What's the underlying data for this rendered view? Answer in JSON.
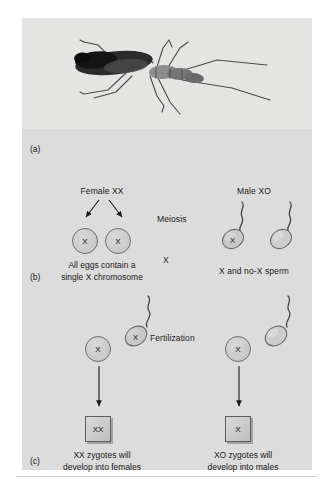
{
  "figure": {
    "panels": [
      {
        "key": "a",
        "letter": "(a)"
      },
      {
        "key": "b",
        "letter": "(b)"
      },
      {
        "key": "c",
        "letter": "(c)"
      }
    ]
  },
  "photo": {
    "subject": "water-strider-insect",
    "alt_text": "Photograph of a water strider insect with a dark elongated body and long slender legs"
  },
  "meiosis": {
    "female_label": "Female XX",
    "male_label": "Male XO",
    "process_label": "Meiosis",
    "cross_symbol": "X",
    "egg_caption_line1": "All eggs contain a",
    "egg_caption_line2": "single X chromosome",
    "sperm_caption": "X and no-X sperm",
    "eggs": [
      {
        "name": "egg-left",
        "glyph": "X"
      },
      {
        "name": "egg-right",
        "glyph": "X"
      }
    ],
    "sperm": [
      {
        "name": "sperm-x",
        "glyph": "X"
      },
      {
        "name": "sperm-no-x",
        "glyph": ""
      }
    ]
  },
  "fertilization": {
    "process_label": "Fertilization",
    "left": {
      "egg_glyph": "X",
      "sperm_glyph": "X",
      "zygote_glyph": "XX",
      "caption_line1": "XX zygotes will",
      "caption_line2": "develop into females"
    },
    "right": {
      "egg_glyph": "X",
      "sperm_glyph": "",
      "zygote_glyph": "X",
      "caption_line1": "XO zygotes will",
      "caption_line2": "develop into males"
    }
  },
  "colors": {
    "panel_background": "#dcdcdc",
    "photo_background": "#e4e4e2",
    "cell_fill": "#cfcfcf",
    "cell_outline": "#6d6d6d",
    "zygote_fill": "#cfcfcf",
    "zygote_outline": "#5d5d5d",
    "text": "#1a1a1a",
    "page_background": "#ffffff"
  }
}
